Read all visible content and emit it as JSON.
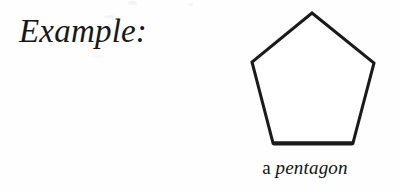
{
  "page": {
    "background_color": "#fefefe",
    "ink_color": "#181818"
  },
  "prompt": {
    "label": "Example:"
  },
  "figure": {
    "shape_name": "pentagon",
    "caption": {
      "article": "a",
      "term": "pentagon",
      "full_text": "a pentagon"
    },
    "drawing": {
      "type": "polygon",
      "sides": 5,
      "fill_color": "#ffffff",
      "stroke_color": "#1a1a1a",
      "stroke_width": 3,
      "vertices": [
        {
          "name": "apex",
          "x": 72,
          "y": 9
        },
        {
          "name": "right-upper",
          "x": 134,
          "y": 59
        },
        {
          "name": "right-lower",
          "x": 113,
          "y": 139
        },
        {
          "name": "left-lower",
          "x": 33,
          "y": 139
        },
        {
          "name": "left-upper",
          "x": 12,
          "y": 58
        }
      ],
      "points_string": "72,9 134,59 113,139 33,139 12,58"
    }
  }
}
